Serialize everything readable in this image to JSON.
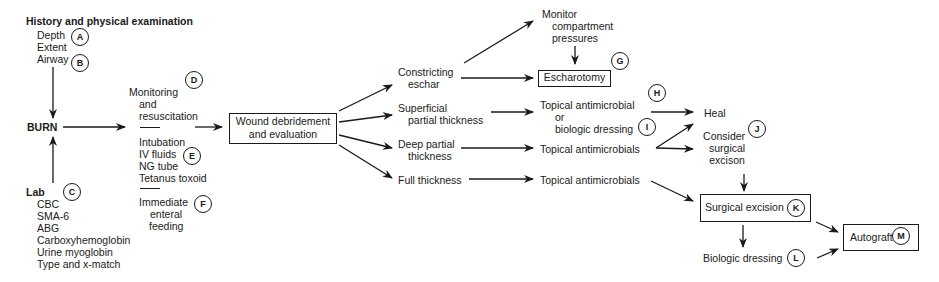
{
  "history": {
    "title": "History and physical examination",
    "items": [
      "Depth",
      "Extent",
      "Airway"
    ],
    "labels": {
      "depth": "A",
      "airway": "B"
    }
  },
  "burn": "BURN",
  "lab": {
    "title": "Lab",
    "label": "C",
    "items": [
      "CBC",
      "SMA-6",
      "ABG",
      "Carboxyhemoglobin",
      "Urine myoglobin",
      "Type and x-match"
    ]
  },
  "monitoring": {
    "lines": [
      "Monitoring",
      "and",
      "resuscitation"
    ],
    "label": "D"
  },
  "interventions": {
    "items": [
      "Intubation",
      "IV fluids",
      "NG tube",
      "Tetanus toxoid"
    ],
    "label": "E"
  },
  "feeding": {
    "lines": [
      "Immediate",
      "enteral",
      "feeding"
    ],
    "label": "F"
  },
  "wound": {
    "lines": [
      "Wound debridement",
      "and evaluation"
    ]
  },
  "depths": {
    "constricting": [
      "Constricting",
      "eschar"
    ],
    "superficial": [
      "Superficial",
      "partial thickness"
    ],
    "deep": [
      "Deep partial",
      "thickness"
    ],
    "full": [
      "Full thickness"
    ]
  },
  "monitor_compartment": [
    "Monitor",
    "compartment",
    "pressures"
  ],
  "escharotomy": {
    "text": "Escharotomy",
    "label": "G"
  },
  "topical_or_bio": {
    "lines": [
      "Topical antimicrobial",
      "or",
      "biologic dressing"
    ],
    "label_top": "H",
    "label_bottom": "I"
  },
  "topical_deep": "Topical antimicrobials",
  "topical_full": "Topical antimicrobials",
  "heal": "Heal",
  "consider": {
    "lines": [
      "Consider",
      "surgical",
      "excison"
    ],
    "label": "J"
  },
  "surgical_excision": {
    "text": "Surgical excision",
    "label": "K"
  },
  "biologic_dressing": {
    "text": "Biologic dressing",
    "label": "L"
  },
  "autograft": {
    "text": "Autograft",
    "label": "M"
  }
}
